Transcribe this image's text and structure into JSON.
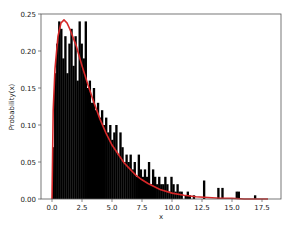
{
  "chart_data": {
    "type": "bar",
    "subtype": "histogram_with_pdf_overlay",
    "title": "",
    "xlabel": "x",
    "ylabel": "Probability(x)",
    "xlim": [
      -1.5,
      18.5
    ],
    "ylim": [
      0.0,
      0.25
    ],
    "xticks": [
      0.0,
      2.5,
      5.0,
      7.5,
      10.0,
      12.5,
      15.0,
      17.5
    ],
    "xtick_labels": [
      "0.0",
      "2.5",
      "5.0",
      "7.5",
      "10.0",
      "12.5",
      "15.0",
      "17.5"
    ],
    "yticks": [
      0.0,
      0.05,
      0.1,
      0.15,
      0.2,
      0.25
    ],
    "ytick_labels": [
      "0.00",
      "0.05",
      "0.10",
      "0.15",
      "0.20",
      "0.25"
    ],
    "grid": false,
    "legend": null,
    "histogram": {
      "color": "#000000",
      "bin_start": 0.0,
      "bin_width": 0.17,
      "values": [
        0.07,
        0.17,
        0.21,
        0.24,
        0.23,
        0.19,
        0.22,
        0.17,
        0.21,
        0.23,
        0.18,
        0.22,
        0.16,
        0.24,
        0.21,
        0.19,
        0.24,
        0.15,
        0.16,
        0.13,
        0.15,
        0.12,
        0.13,
        0.11,
        0.12,
        0.1,
        0.11,
        0.09,
        0.1,
        0.08,
        0.09,
        0.1,
        0.06,
        0.09,
        0.07,
        0.05,
        0.06,
        0.05,
        0.06,
        0.04,
        0.05,
        0.03,
        0.06,
        0.04,
        0.03,
        0.04,
        0.03,
        0.05,
        0.02,
        0.04,
        0.03,
        0.02,
        0.03,
        0.02,
        0.02,
        0.03,
        0.02,
        0.01,
        0.03,
        0.02,
        0.01,
        0.02,
        0.01,
        0.01,
        0.0,
        0.005,
        0.01,
        0.005,
        0.0,
        0.005,
        0.0,
        0.0,
        0.0,
        0.0,
        0.025,
        0.0,
        0.0,
        0.0,
        0.0,
        0.0,
        0.0,
        0.015,
        0.0,
        0.015,
        0.0,
        0.0,
        0.0,
        0.0,
        0.0,
        0.0,
        0.01,
        0.01,
        0.0,
        0.0,
        0.0,
        0.0,
        0.0,
        0.0,
        0.0,
        0.005
      ]
    },
    "series": [
      {
        "name": "pdf",
        "type": "line",
        "color": "#d62728",
        "distribution": "gamma(shape=1.5, scale=2)",
        "x": [
          0.0,
          0.1,
          0.25,
          0.5,
          0.75,
          1.0,
          1.25,
          1.5,
          2.0,
          2.5,
          3.0,
          3.5,
          4.0,
          4.5,
          5.0,
          6.0,
          7.0,
          7.5,
          8.0,
          9.0,
          10.0,
          11.0,
          12.0,
          13.0,
          14.0,
          15.0,
          16.0,
          17.0,
          18.0
        ],
        "values": [
          0.0,
          0.12,
          0.176,
          0.22,
          0.238,
          0.242,
          0.238,
          0.229,
          0.208,
          0.18,
          0.154,
          0.13,
          0.108,
          0.089,
          0.073,
          0.049,
          0.032,
          0.026,
          0.021,
          0.013,
          0.008,
          0.005,
          0.003,
          0.002,
          0.001,
          0.001,
          0.0,
          0.0,
          0.0
        ]
      }
    ]
  },
  "caption": "Figure: histogram with fitted density"
}
